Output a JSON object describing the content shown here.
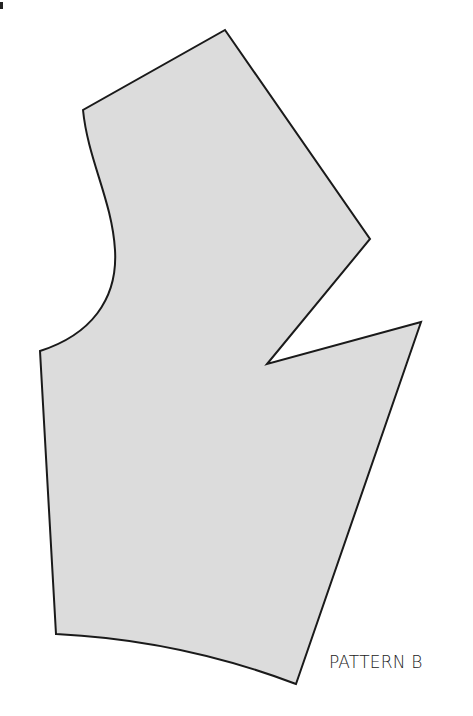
{
  "diagram": {
    "type": "sewing-pattern-piece",
    "label": "PATTERN B",
    "colors": {
      "fill": "#dcdcdc",
      "stroke": "#1a1a1a",
      "background": "#ffffff",
      "label": "#222222"
    },
    "vertices": {
      "top": [
        225,
        30
      ],
      "upper_left": [
        83,
        110
      ],
      "armhole_curve_control": [
        115,
        250
      ],
      "lower_left": [
        40,
        351
      ],
      "right_shoulder": [
        370,
        239
      ],
      "dart_point": [
        267,
        364
      ],
      "dart_tip_right": [
        421,
        322
      ],
      "bottom_right": [
        296,
        684
      ],
      "bottom_left": [
        56,
        634
      ]
    }
  }
}
